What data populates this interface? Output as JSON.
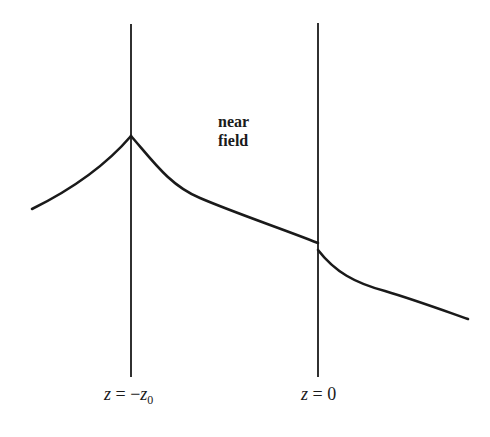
{
  "diagram": {
    "region_label": {
      "line1": "near",
      "line2": "field"
    },
    "boundaries": [
      {
        "name": "z = -z0",
        "var": "z",
        "eq": " = −",
        "rhs_var": "z",
        "rhs_sub": "0",
        "x": 131
      },
      {
        "name": "z = 0",
        "var": "z",
        "eq": " = ",
        "rhs_value": "0",
        "x": 318
      }
    ],
    "curve": {
      "description": "Field profile rising to a cusp at z = -z0, decaying through the near field, with a downward discontinuity at z = 0, then continuing to decay",
      "segments": [
        {
          "from": [
            32,
            209
          ],
          "to": [
            131,
            136
          ],
          "shape": "concave-up rise"
        },
        {
          "from": [
            131,
            136
          ],
          "to": [
            318,
            243
          ],
          "shape": "convex decay"
        },
        {
          "from": [
            318,
            250
          ],
          "to": [
            468,
            319
          ],
          "shape": "convex decay"
        }
      ]
    },
    "colors": {
      "line": "#1a1a1a",
      "background": "#ffffff"
    }
  }
}
